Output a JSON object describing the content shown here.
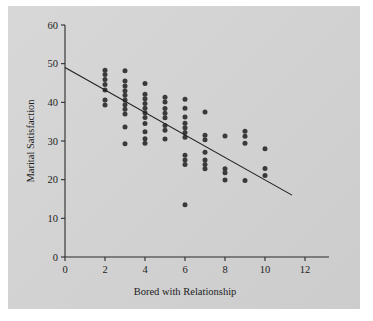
{
  "figure": {
    "background_color": "#d3d3d3",
    "page_color": "#ffffff",
    "point_color": "#3a3a3a",
    "axis_color": "#2b2b2b",
    "line_color": "#1e1e1e"
  },
  "chart_data": {
    "type": "scatter",
    "title": "",
    "xlabel": "Bored with Relationship",
    "ylabel": "Marital Satisfaction",
    "xlim": [
      0,
      13.2
    ],
    "ylim": [
      0,
      62
    ],
    "xticks": [
      0,
      2,
      4,
      6,
      8,
      10,
      12
    ],
    "xtick_labels": [
      "0",
      "2",
      "4",
      "6",
      "8",
      "10",
      "12"
    ],
    "yticks": [
      0,
      10,
      20,
      30,
      40,
      50,
      60
    ],
    "ytick_labels": [
      "0",
      "10",
      "20",
      "30",
      "40",
      "50",
      "60"
    ],
    "grid": false,
    "legend": null,
    "points": [
      {
        "x": 2,
        "y": 48.3
      },
      {
        "x": 2,
        "y": 47.2
      },
      {
        "x": 2,
        "y": 45.9
      },
      {
        "x": 2,
        "y": 44.6
      },
      {
        "x": 2,
        "y": 43.2
      },
      {
        "x": 2,
        "y": 40.6
      },
      {
        "x": 2,
        "y": 39.3
      },
      {
        "x": 3,
        "y": 48.2
      },
      {
        "x": 3,
        "y": 45.5
      },
      {
        "x": 3,
        "y": 44.2
      },
      {
        "x": 3,
        "y": 43.0
      },
      {
        "x": 3,
        "y": 41.8
      },
      {
        "x": 3,
        "y": 40.6
      },
      {
        "x": 3,
        "y": 39.4
      },
      {
        "x": 3,
        "y": 38.2
      },
      {
        "x": 3,
        "y": 37.0
      },
      {
        "x": 3,
        "y": 33.6
      },
      {
        "x": 3,
        "y": 29.3
      },
      {
        "x": 4,
        "y": 44.9
      },
      {
        "x": 4,
        "y": 42.1
      },
      {
        "x": 4,
        "y": 40.9
      },
      {
        "x": 4,
        "y": 39.7
      },
      {
        "x": 4,
        "y": 38.5
      },
      {
        "x": 4,
        "y": 37.3
      },
      {
        "x": 4,
        "y": 36.1
      },
      {
        "x": 4,
        "y": 34.5
      },
      {
        "x": 4,
        "y": 32.4
      },
      {
        "x": 4,
        "y": 30.6
      },
      {
        "x": 4,
        "y": 29.4
      },
      {
        "x": 5,
        "y": 41.3
      },
      {
        "x": 5,
        "y": 40.1
      },
      {
        "x": 5,
        "y": 38.4
      },
      {
        "x": 5,
        "y": 37.2
      },
      {
        "x": 5,
        "y": 36.0
      },
      {
        "x": 5,
        "y": 34.0
      },
      {
        "x": 5,
        "y": 32.8
      },
      {
        "x": 5,
        "y": 30.5
      },
      {
        "x": 6,
        "y": 40.8
      },
      {
        "x": 6,
        "y": 38.5
      },
      {
        "x": 6,
        "y": 36.2
      },
      {
        "x": 6,
        "y": 34.6
      },
      {
        "x": 6,
        "y": 33.4
      },
      {
        "x": 6,
        "y": 32.2
      },
      {
        "x": 6,
        "y": 31.0
      },
      {
        "x": 6,
        "y": 26.3
      },
      {
        "x": 6,
        "y": 25.1
      },
      {
        "x": 6,
        "y": 23.9
      },
      {
        "x": 6,
        "y": 13.5
      },
      {
        "x": 7,
        "y": 37.5
      },
      {
        "x": 7,
        "y": 31.5
      },
      {
        "x": 7,
        "y": 30.3
      },
      {
        "x": 7,
        "y": 27.1
      },
      {
        "x": 7,
        "y": 25.1
      },
      {
        "x": 7,
        "y": 23.9
      },
      {
        "x": 7,
        "y": 22.8
      },
      {
        "x": 8,
        "y": 31.3
      },
      {
        "x": 8,
        "y": 22.8
      },
      {
        "x": 8,
        "y": 21.8
      },
      {
        "x": 8,
        "y": 19.9
      },
      {
        "x": 9,
        "y": 32.5
      },
      {
        "x": 9,
        "y": 31.2
      },
      {
        "x": 9,
        "y": 29.4
      },
      {
        "x": 9,
        "y": 19.8
      },
      {
        "x": 10,
        "y": 28.0
      },
      {
        "x": 10,
        "y": 22.9
      },
      {
        "x": 10,
        "y": 21.1
      }
    ],
    "fit_line": {
      "x_start": 0,
      "y_start": 49.0,
      "x_end": 11.35,
      "y_end": 16.0
    }
  }
}
